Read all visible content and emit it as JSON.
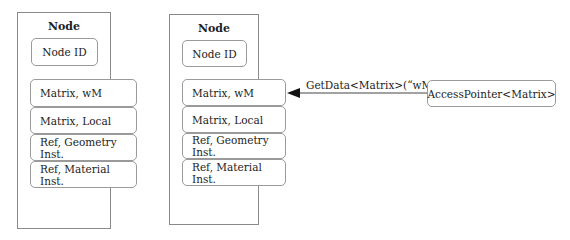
{
  "nodes": [
    {
      "title": "Node",
      "id_label": "Node ID",
      "fields": [
        "Matrix, wM",
        "Matrix, Local",
        "Ref, Geometry Inst.",
        "Ref, Material Inst."
      ]
    },
    {
      "title": "Node",
      "id_label": "Node ID",
      "fields": [
        "Matrix, wM",
        "Matrix, Local",
        "Ref, Geometry Inst.",
        "Ref, Material Inst."
      ]
    }
  ],
  "arrow": {
    "label": "GetData<Matrix>(“wM”)"
  },
  "accessor": {
    "label": "AccessPointer<Matrix>"
  }
}
